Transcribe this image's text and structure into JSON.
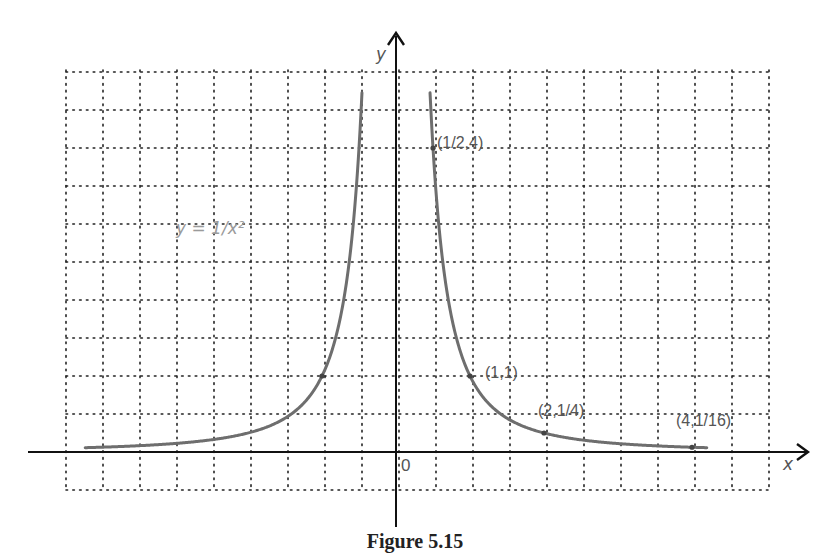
{
  "chart_data": {
    "type": "line",
    "title": "",
    "function_label": "y = 1/x²",
    "xlabel": "x",
    "ylabel": "y",
    "origin_label": "0",
    "xlim": [
      -4.5,
      5
    ],
    "ylim": [
      -1,
      4.5
    ],
    "grid": true,
    "grid_style": "dotted",
    "grid_step": 0.5,
    "series": [
      {
        "name": "y = 1/x²",
        "branches": [
          {
            "x_range": [
              -4.2,
              -0.46
            ]
          },
          {
            "x_range": [
              0.46,
              4.2
            ]
          }
        ]
      }
    ],
    "points": [
      {
        "x": 0.5,
        "y": 4,
        "label": "(1/2,4)"
      },
      {
        "x": 1,
        "y": 1,
        "label": "(1,1)"
      },
      {
        "x": 2,
        "y": 0.25,
        "label": "(2,1/4)"
      },
      {
        "x": 4,
        "y": 0.0625,
        "label": "(4,1/16)"
      },
      {
        "x": -1,
        "y": 1,
        "label": ""
      }
    ],
    "caption": "Figure 5.15",
    "colors": {
      "curve": "#6e6e6e",
      "axes": "#111111",
      "grid": "#222222",
      "labels": "#555555"
    }
  },
  "labels": {
    "x_axis": "x",
    "y_axis": "y",
    "origin": "0",
    "function": "y = 1/x²",
    "p_half": "(1/2,4)",
    "p_one": "(1,1)",
    "p_two": "(2,1/4)",
    "p_four": "(4,1/16)",
    "caption": "Figure 5.15"
  }
}
